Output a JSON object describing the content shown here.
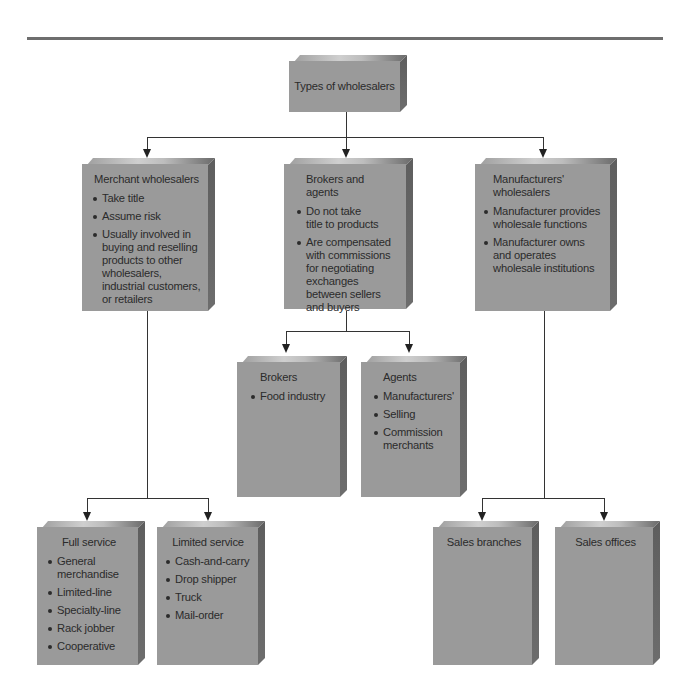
{
  "diagram": {
    "root": {
      "label": "Types of wholesalers"
    },
    "level1": [
      {
        "title": "Merchant wholesalers",
        "bullets": [
          "Take title",
          "Assume risk",
          "Usually involved in buying and reselling products to other wholesalers, industrial customers, or retailers"
        ]
      },
      {
        "title": "Brokers and agents",
        "bullets": [
          "Do not take title to products",
          "Are compensated with commissions for negotiating exchanges between sellers and buyers"
        ]
      },
      {
        "title": "Manufacturers' wholesalers",
        "bullets": [
          "Manufacturer provides wholesale functions",
          "Manufacturer owns and operates wholesale institutions"
        ]
      }
    ],
    "merchant_children": [
      {
        "title": "Full service",
        "bullets": [
          "General merchandise",
          "Limited-line",
          "Specialty-line",
          "Rack jobber",
          "Cooperative"
        ]
      },
      {
        "title": "Limited service",
        "bullets": [
          "Cash-and-carry",
          "Drop shipper",
          "Truck",
          "Mail-order"
        ]
      }
    ],
    "broker_children": [
      {
        "title": "Brokers",
        "bullets": [
          "Food industry"
        ]
      },
      {
        "title": "Agents",
        "bullets": [
          "Manufacturers'",
          "Selling",
          "Commission merchants"
        ]
      }
    ],
    "manufacturer_children": [
      {
        "title": "Sales branches",
        "bullets": []
      },
      {
        "title": "Sales offices",
        "bullets": []
      }
    ],
    "colors": {
      "box_face": "#9a9a9a",
      "box_side": "#5e5e5e",
      "text": "#2b2b2b",
      "connector": "#333333",
      "rule": "#6e6e6e"
    }
  }
}
